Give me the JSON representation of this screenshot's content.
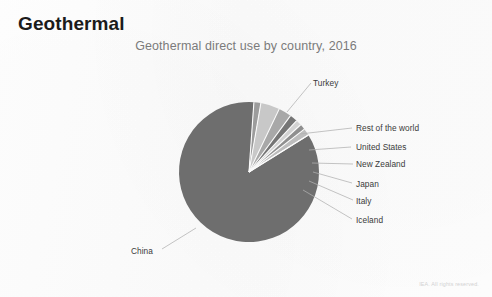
{
  "slide": {
    "heading": "Geothermal",
    "footer_note": "IEA. All rights reserved."
  },
  "chart_data": {
    "type": "pie",
    "title": "Geothermal direct use by country, 2016",
    "xlabel": "",
    "ylabel": "",
    "legend_position": "callout-labels",
    "grid": false,
    "unit": "share of total geothermal direct use",
    "categories": [
      "China",
      "Turkey",
      "Rest of the world",
      "United States",
      "New Zealand",
      "Japan",
      "Italy",
      "Iceland"
    ],
    "values": [
      85.0,
      1.6,
      4.4,
      3.0,
      1.8,
      1.3,
      1.3,
      1.6
    ],
    "colors": [
      "#6e6e6e",
      "#9c9c9c",
      "#c8c8c8",
      "#a8a8a8",
      "#757575",
      "#d2d2d2",
      "#8f8f8f",
      "#bdbdbd"
    ],
    "labels": [
      {
        "name": "China",
        "value": 85.0
      },
      {
        "name": "Turkey",
        "value": 1.6
      },
      {
        "name": "Rest of the world",
        "value": 4.4
      },
      {
        "name": "United States",
        "value": 3.0
      },
      {
        "name": "New Zealand",
        "value": 1.8
      },
      {
        "name": "Japan",
        "value": 1.3
      },
      {
        "name": "Italy",
        "value": 1.3
      },
      {
        "name": "Iceland",
        "value": 1.6
      }
    ]
  },
  "callouts": {
    "turkey": "Turkey",
    "rest_of_the_world": "Rest of the world",
    "united_states": "United States",
    "new_zealand": "New Zealand",
    "japan": "Japan",
    "italy": "Italy",
    "iceland": "Iceland",
    "china": "China"
  }
}
